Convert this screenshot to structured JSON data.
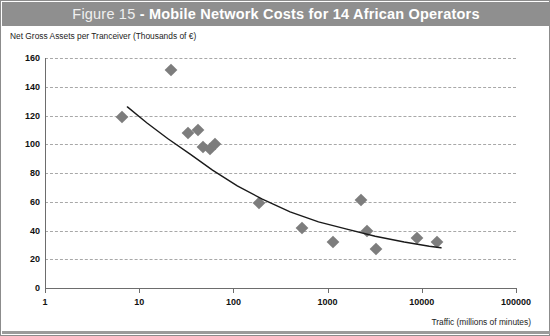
{
  "figure": {
    "title_prefix": "Figure 15 ",
    "title_main": "- Mobile Network Costs for 14 African Operators",
    "banner_color": "#8f8f8f",
    "marker_color": "#7d7d7d",
    "trend_color": "#1a1a1a",
    "grid_color": "#a8a8a8"
  },
  "chart_data": {
    "type": "scatter",
    "title": "Figure 15 - Mobile Network Costs for 14 African Operators",
    "xlabel": "Traffic (millions of minutes)",
    "ylabel": "Net Gross Assets per Tranceiver (Thousands of €)",
    "xscale": "log",
    "yscale": "linear",
    "xlim": [
      1,
      100000
    ],
    "ylim": [
      0,
      160
    ],
    "grid": true,
    "legend": "none",
    "xticks": [
      1,
      10,
      100,
      1000,
      10000,
      100000
    ],
    "xtick_labels": [
      "1",
      "10",
      "100",
      "1000",
      "10000",
      "100000"
    ],
    "yticks": [
      0,
      20,
      40,
      60,
      80,
      100,
      120,
      140,
      160
    ],
    "ytick_labels": [
      "0",
      "20",
      "40",
      "60",
      "80",
      "100",
      "120",
      "140",
      "160"
    ],
    "points": [
      {
        "x": 6.5,
        "y": 119
      },
      {
        "x": 22,
        "y": 152
      },
      {
        "x": 33,
        "y": 108
      },
      {
        "x": 42,
        "y": 110
      },
      {
        "x": 48,
        "y": 98
      },
      {
        "x": 57,
        "y": 97
      },
      {
        "x": 64,
        "y": 100
      },
      {
        "x": 185,
        "y": 59
      },
      {
        "x": 530,
        "y": 42
      },
      {
        "x": 1150,
        "y": 32
      },
      {
        "x": 2250,
        "y": 61
      },
      {
        "x": 2600,
        "y": 40
      },
      {
        "x": 3300,
        "y": 27
      },
      {
        "x": 9000,
        "y": 35
      },
      {
        "x": 14500,
        "y": 32
      }
    ],
    "trendline": {
      "label": "power-law fit",
      "points": [
        {
          "x": 7.5,
          "y": 126
        },
        {
          "x": 12,
          "y": 115
        },
        {
          "x": 20,
          "y": 104
        },
        {
          "x": 35,
          "y": 93
        },
        {
          "x": 60,
          "y": 82
        },
        {
          "x": 110,
          "y": 71
        },
        {
          "x": 200,
          "y": 62
        },
        {
          "x": 400,
          "y": 53
        },
        {
          "x": 800,
          "y": 46
        },
        {
          "x": 1600,
          "y": 41
        },
        {
          "x": 3200,
          "y": 36
        },
        {
          "x": 6500,
          "y": 32
        },
        {
          "x": 12000,
          "y": 29
        },
        {
          "x": 16000,
          "y": 28
        }
      ]
    }
  }
}
